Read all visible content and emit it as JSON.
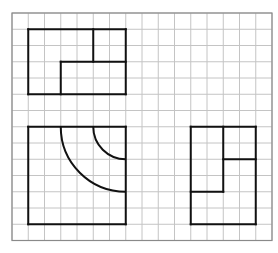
{
  "diagram": {
    "type": "three-view orthographic drawing on grid",
    "grid": {
      "origin_x": 12,
      "origin_y": 13,
      "cell": 16.25,
      "cols": 16,
      "rows": 14,
      "line_color": "#c4c4c4",
      "border_color": "#8a8a8a"
    },
    "stroke_color": "#111111",
    "views": [
      {
        "name": "top-view",
        "segments": [
          [
            1,
            1,
            7,
            1
          ],
          [
            7,
            1,
            7,
            5
          ],
          [
            7,
            5,
            1,
            5
          ],
          [
            1,
            5,
            1,
            1
          ],
          [
            5,
            1,
            5,
            3
          ],
          [
            3,
            3,
            7,
            3
          ],
          [
            3,
            3,
            3,
            5
          ]
        ],
        "arcs": []
      },
      {
        "name": "front-view",
        "segments": [
          [
            1,
            7,
            7,
            7
          ],
          [
            7,
            7,
            7,
            13
          ],
          [
            7,
            13,
            1,
            13
          ],
          [
            1,
            13,
            1,
            7
          ]
        ],
        "arcs": [
          {
            "cx": 7,
            "cy": 7,
            "r": 4
          },
          {
            "cx": 7,
            "cy": 7,
            "r": 2
          }
        ]
      },
      {
        "name": "side-view",
        "segments": [
          [
            11,
            7,
            15,
            7
          ],
          [
            15,
            7,
            15,
            13
          ],
          [
            15,
            13,
            11,
            13
          ],
          [
            11,
            13,
            11,
            7
          ],
          [
            13,
            7,
            13,
            11
          ],
          [
            11,
            11,
            13,
            11
          ],
          [
            13,
            9,
            15,
            9
          ]
        ],
        "arcs": []
      }
    ]
  }
}
